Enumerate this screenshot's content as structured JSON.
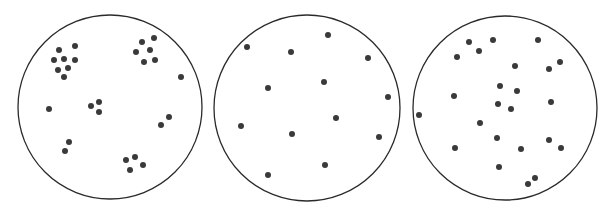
{
  "diagram": {
    "stroke_color": "#2a2a2a",
    "dot_color": "#3a3a3a",
    "background": "#ffffff",
    "panels": [
      {
        "id": "clumped",
        "circle": {
          "cx": 110,
          "cy": 107,
          "r": 92
        },
        "dots": [
          [
            59,
            50
          ],
          [
            75,
            46
          ],
          [
            54,
            60
          ],
          [
            64,
            59
          ],
          [
            75,
            60
          ],
          [
            58,
            70
          ],
          [
            68,
            68
          ],
          [
            64,
            77
          ],
          [
            154,
            38
          ],
          [
            142,
            42
          ],
          [
            150,
            50
          ],
          [
            136,
            52
          ],
          [
            155,
            60
          ],
          [
            144,
            62
          ],
          [
            181,
            77
          ],
          [
            49,
            109
          ],
          [
            99,
            102
          ],
          [
            91,
            106
          ],
          [
            99,
            112
          ],
          [
            169,
            117
          ],
          [
            161,
            125
          ],
          [
            69,
            142
          ],
          [
            65,
            151
          ],
          [
            135,
            157
          ],
          [
            126,
            160
          ],
          [
            143,
            165
          ],
          [
            130,
            170
          ]
        ]
      },
      {
        "id": "uniform",
        "circle": {
          "cx": 307,
          "cy": 108,
          "r": 93
        },
        "dots": [
          [
            247,
            47
          ],
          [
            291,
            52
          ],
          [
            328,
            35
          ],
          [
            368,
            58
          ],
          [
            268,
            88
          ],
          [
            324,
            82
          ],
          [
            388,
            97
          ],
          [
            241,
            126
          ],
          [
            336,
            118
          ],
          [
            292,
            134
          ],
          [
            379,
            137
          ],
          [
            325,
            165
          ],
          [
            268,
            175
          ]
        ]
      },
      {
        "id": "random",
        "circle": {
          "cx": 505,
          "cy": 108,
          "r": 92
        },
        "dots": [
          [
            469,
            42
          ],
          [
            493,
            40
          ],
          [
            538,
            40
          ],
          [
            479,
            51
          ],
          [
            457,
            57
          ],
          [
            515,
            66
          ],
          [
            549,
            69
          ],
          [
            560,
            62
          ],
          [
            500,
            86
          ],
          [
            517,
            91
          ],
          [
            454,
            96
          ],
          [
            498,
            104
          ],
          [
            511,
            109
          ],
          [
            551,
            102
          ],
          [
            419,
            115
          ],
          [
            480,
            123
          ],
          [
            497,
            138
          ],
          [
            549,
            140
          ],
          [
            455,
            148
          ],
          [
            521,
            149
          ],
          [
            561,
            148
          ],
          [
            499,
            167
          ],
          [
            535,
            178
          ],
          [
            528,
            184
          ]
        ]
      }
    ]
  }
}
